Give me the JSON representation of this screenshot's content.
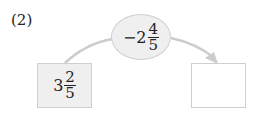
{
  "problem": {
    "label": "(2)",
    "operation": {
      "sign": "−",
      "whole": "2",
      "numerator": "4",
      "denominator": "5"
    },
    "start_value": {
      "whole": "3",
      "numerator": "2",
      "denominator": "5"
    },
    "answer_value": ""
  },
  "colors": {
    "shape_fill": "#efefef",
    "shape_border": "#cfcfcf",
    "arrow": "#cccccc"
  }
}
